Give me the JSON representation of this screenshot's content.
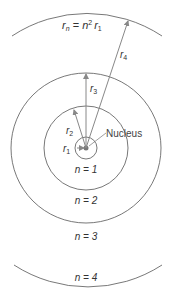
{
  "diagram": {
    "formula": {
      "r": "r",
      "sub_n": "n",
      "eq": " = ",
      "n": "n",
      "sup": "2",
      "r1": "r",
      "sub_1": "1"
    },
    "nucleus_label": "Nucleus",
    "radius_labels": [
      {
        "r": "r",
        "sub": "1"
      },
      {
        "r": "r",
        "sub": "2"
      },
      {
        "r": "r",
        "sub": "3"
      },
      {
        "r": "r",
        "sub": "4"
      }
    ],
    "orbit_labels": [
      "n = 1",
      "n = 2",
      "n = 3",
      "n = 4"
    ],
    "colors": {
      "orbit": "#555555",
      "arrow": "#8a8a8a",
      "text": "#333333"
    }
  }
}
